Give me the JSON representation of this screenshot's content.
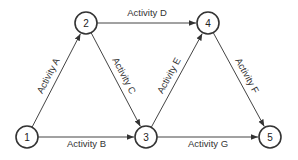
{
  "diagram": {
    "type": "activity-on-arrow network",
    "nodes": [
      {
        "id": "1",
        "label": "1",
        "x": 27,
        "y": 137
      },
      {
        "id": "2",
        "label": "2",
        "x": 86,
        "y": 23
      },
      {
        "id": "3",
        "label": "3",
        "x": 146,
        "y": 137
      },
      {
        "id": "4",
        "label": "4",
        "x": 208,
        "y": 23
      },
      {
        "id": "5",
        "label": "5",
        "x": 270,
        "y": 137
      }
    ],
    "edges": [
      {
        "from": "1",
        "to": "2",
        "label": "Activity A"
      },
      {
        "from": "1",
        "to": "3",
        "label": "Activity B"
      },
      {
        "from": "2",
        "to": "3",
        "label": "Activity C"
      },
      {
        "from": "2",
        "to": "4",
        "label": "Activity D"
      },
      {
        "from": "3",
        "to": "4",
        "label": "Activity E"
      },
      {
        "from": "4",
        "to": "5",
        "label": "Activity F"
      },
      {
        "from": "3",
        "to": "5",
        "label": "Activity G"
      }
    ]
  }
}
